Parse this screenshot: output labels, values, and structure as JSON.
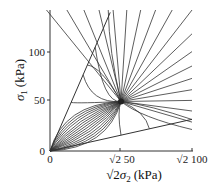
{
  "chart_data": {
    "type": "line",
    "title": "",
    "xlabel": "√2σ₂ (kPa)",
    "ylabel": "σ₁ (kPa)",
    "x_ticks": [
      {
        "value": 0,
        "label": "0"
      },
      {
        "value": 70.71,
        "label": "√2 50"
      },
      {
        "value": 141.42,
        "label": "√2 100"
      }
    ],
    "y_ticks": [
      {
        "value": 0,
        "label": "0"
      },
      {
        "value": 50,
        "label": "50"
      },
      {
        "value": 100,
        "label": "100"
      }
    ],
    "xlim": [
      0,
      141.42
    ],
    "ylim": [
      0,
      140
    ],
    "grid": false,
    "legend": null,
    "node": {
      "x": 70.71,
      "y": 50
    },
    "boundaries": [
      {
        "name": "upper",
        "from": [
          0,
          0
        ],
        "to": [
          60,
          140
        ]
      },
      {
        "name": "lower",
        "from": [
          0,
          0
        ],
        "to": [
          141.42,
          32
        ]
      }
    ]
  },
  "axes": {
    "x_label_prefix": "√2",
    "x_label_var": "σ",
    "x_label_sub": "2",
    "x_label_unit": "(kPa)",
    "y_label_var": "σ",
    "y_label_sub": "1",
    "y_label_unit": "(kPa)",
    "x_tick_0": "0",
    "x_tick_1": "√2 50",
    "x_tick_2": "√2 100",
    "y_tick_0": "0",
    "y_tick_1": "50",
    "y_tick_2": "100"
  }
}
